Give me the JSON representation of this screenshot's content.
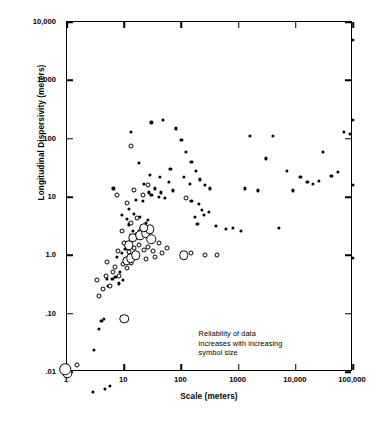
{
  "chart_data": {
    "type": "scatter",
    "title": "",
    "xlabel": "Scale (meters)",
    "ylabel": "Longitudinal Dispersivity (meters)",
    "xscale": "log",
    "yscale": "log",
    "xlim": [
      1,
      100000
    ],
    "ylim": [
      0.01,
      10000
    ],
    "grid": false,
    "legend_position": "none",
    "xticks": [
      {
        "value": 1,
        "label": "1"
      },
      {
        "value": 10,
        "label": "10"
      },
      {
        "value": 100,
        "label": "100"
      },
      {
        "value": 1000,
        "label": "1000"
      },
      {
        "value": 10000,
        "label": "10,000"
      },
      {
        "value": 100000,
        "label": "100,000"
      }
    ],
    "yticks": [
      {
        "value": 0.01,
        "label": ".01"
      },
      {
        "value": 0.1,
        "label": ".10"
      },
      {
        "value": 1,
        "label": "1.0"
      },
      {
        "value": 10,
        "label": "10"
      },
      {
        "value": 100,
        "label": "100"
      },
      {
        "value": 1000,
        "label": "1,000"
      },
      {
        "value": 10000,
        "label": "10,000"
      }
    ],
    "annotations": [
      {
        "text": "Reliability of data\nincreases with increasing\nsymbol size",
        "x": 200,
        "y": 0.055
      }
    ],
    "symbol_sizes": {
      "small": "low reliability",
      "medium": "intermediate reliability",
      "large": "high reliability"
    },
    "series": [
      {
        "name": "Low reliability (small filled symbol)",
        "symbol": "filled-small",
        "points": [
          [
            2.8,
            0.0045
          ],
          [
            4.6,
            0.0052
          ],
          [
            5.6,
            0.0058
          ],
          [
            3.0,
            0.024
          ],
          [
            3.6,
            0.055
          ],
          [
            4.0,
            0.075
          ],
          [
            4.4,
            0.082
          ],
          [
            5.2,
            0.3
          ],
          [
            6.2,
            0.4
          ],
          [
            7.0,
            0.42
          ],
          [
            8.0,
            0.33
          ],
          [
            5.0,
            0.4
          ],
          [
            8.5,
            0.52
          ],
          [
            9.5,
            0.38
          ],
          [
            7.5,
            0.95
          ],
          [
            9.0,
            1.1
          ],
          [
            10.5,
            1.3
          ],
          [
            13,
            2.2
          ],
          [
            14,
            2.6
          ],
          [
            16,
            2.3
          ],
          [
            17,
            2.0
          ],
          [
            18,
            2.6
          ],
          [
            20,
            2.9
          ],
          [
            12,
            3.4
          ],
          [
            22,
            2.4
          ],
          [
            11,
            4.2
          ],
          [
            15,
            5.2
          ],
          [
            19,
            4.6
          ],
          [
            24,
            3.6
          ],
          [
            26,
            4.0
          ],
          [
            9.0,
            5.0
          ],
          [
            12,
            6.2
          ],
          [
            6.5,
            14
          ],
          [
            16,
            9.0
          ],
          [
            21,
            8.5
          ],
          [
            27,
            12
          ],
          [
            30,
            11
          ],
          [
            34,
            14
          ],
          [
            40,
            10
          ],
          [
            22,
            17
          ],
          [
            44,
            12
          ],
          [
            52,
            9.5
          ],
          [
            60,
            18
          ],
          [
            70,
            13
          ],
          [
            18,
            38
          ],
          [
            28,
            24
          ],
          [
            42,
            22
          ],
          [
            64,
            30
          ],
          [
            13,
            130
          ],
          [
            30,
            190
          ],
          [
            48,
            210
          ],
          [
            80,
            150
          ],
          [
            100,
            95
          ],
          [
            120,
            60
          ],
          [
            150,
            40
          ],
          [
            180,
            28
          ],
          [
            110,
            22
          ],
          [
            140,
            17
          ],
          [
            210,
            20
          ],
          [
            260,
            16
          ],
          [
            320,
            14
          ],
          [
            150,
            8.5
          ],
          [
            200,
            7.5
          ],
          [
            230,
            6.0
          ],
          [
            300,
            5.5
          ],
          [
            250,
            5.0
          ],
          [
            170,
            4.5
          ],
          [
            190,
            3.5
          ],
          [
            400,
            3.2
          ],
          [
            600,
            2.8
          ],
          [
            800,
            3.0
          ],
          [
            1100,
            2.6
          ],
          [
            1300,
            14
          ],
          [
            2200,
            13
          ],
          [
            3000,
            46
          ],
          [
            1600,
            110
          ],
          [
            5000,
            3.0
          ],
          [
            4000,
            110
          ],
          [
            7000,
            28
          ],
          [
            9000,
            13
          ],
          [
            12000,
            22
          ],
          [
            16000,
            18
          ],
          [
            20000,
            17
          ],
          [
            25000,
            19
          ],
          [
            30000,
            60
          ],
          [
            42000,
            23
          ],
          [
            55000,
            27
          ],
          [
            70000,
            130
          ],
          [
            88000,
            120
          ],
          [
            100000,
            5000
          ],
          [
            100000,
            210
          ],
          [
            100000,
            16
          ],
          [
            100000,
            0.9
          ]
        ]
      },
      {
        "name": "Intermediate reliability (open medium symbol)",
        "symbol": "open-medium",
        "points": [
          [
            1.5,
            0.013
          ],
          [
            3.6,
            0.2
          ],
          [
            4.2,
            0.26
          ],
          [
            5.6,
            0.3
          ],
          [
            3.4,
            0.38
          ],
          [
            4.8,
            0.45
          ],
          [
            6.4,
            0.52
          ],
          [
            6.8,
            0.62
          ],
          [
            8.2,
            0.44
          ],
          [
            5.0,
            0.78
          ],
          [
            9.5,
            0.72
          ],
          [
            11,
            0.6
          ],
          [
            13,
            0.75
          ],
          [
            7.8,
            1.2
          ],
          [
            10,
            1.6
          ],
          [
            12,
            1.15
          ],
          [
            15,
            1.35
          ],
          [
            18,
            1.5
          ],
          [
            22,
            1.25
          ],
          [
            26,
            1.4
          ],
          [
            32,
            1.2
          ],
          [
            40,
            1.6
          ],
          [
            46,
            1.1
          ],
          [
            56,
            1.35
          ],
          [
            24,
            0.85
          ],
          [
            34,
            0.95
          ],
          [
            9.0,
            2.6
          ],
          [
            13,
            3.6
          ],
          [
            17,
            4.4
          ],
          [
            11,
            8.0
          ],
          [
            15,
            13
          ],
          [
            21,
            11
          ],
          [
            26,
            16
          ],
          [
            7.5,
            11
          ],
          [
            13,
            75
          ],
          [
            120,
            9.5
          ],
          [
            150,
            1.1
          ],
          [
            260,
            1.0
          ],
          [
            420,
            1.0
          ]
        ]
      },
      {
        "name": "High reliability (open large symbol)",
        "symbol": "open-large",
        "points": [
          [
            1.0,
            0.0095
          ],
          [
            10,
            0.082
          ],
          [
            11,
            0.8
          ],
          [
            13,
            0.9
          ],
          [
            16,
            1.0
          ],
          [
            12,
            1.5
          ],
          [
            14,
            2.0
          ],
          [
            19,
            2.2
          ],
          [
            24,
            2.4
          ],
          [
            30,
            1.9
          ],
          [
            28,
            2.8
          ],
          [
            22,
            3.0
          ],
          [
            110,
            1.0
          ]
        ]
      }
    ]
  }
}
